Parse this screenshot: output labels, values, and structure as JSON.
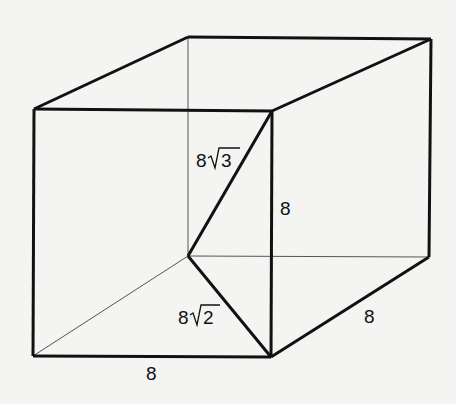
{
  "diagram": {
    "type": "cube-diagonals",
    "colors": {
      "stroke": "#111111",
      "hidden_stroke": "#555555",
      "background": "#f4f4f2"
    },
    "labels": {
      "space_diagonal": "8√3",
      "space_diagonal_coef": "8",
      "space_diagonal_rad": "3",
      "face_diagonal": "8√2",
      "face_diagonal_coef": "8",
      "face_diagonal_rad": "2",
      "front_vertical_edge": "8",
      "bottom_front_edge": "8",
      "bottom_depth_edge": "8"
    }
  }
}
